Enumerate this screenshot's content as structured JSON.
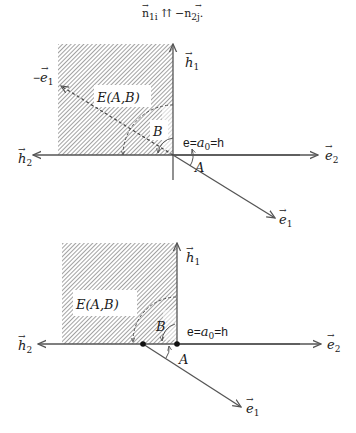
{
  "caption": {
    "n1": "n",
    "n1_sub": "1i",
    "relation": "⇈",
    "minus": "−",
    "n2": "n",
    "n2_sub": "2j",
    "end": "."
  },
  "diagrams": [
    {
      "id": "top",
      "region_label": "E(A,B)",
      "angle_A": "A",
      "angle_B": "B",
      "equation_e": "e=",
      "equation_a": "a",
      "equation_a_sub": "0",
      "equation_h": "=h",
      "axis_h1": "h",
      "axis_h1_sub": "1",
      "axis_h2": "h",
      "axis_h2_sub": "2",
      "axis_e2": "e",
      "axis_e2_sub": "2",
      "axis_e1": "e",
      "axis_e1_sub": "1",
      "axis_neg_e1_minus": "−",
      "axis_neg_e1": "e",
      "axis_neg_e1_sub": "1"
    },
    {
      "id": "bottom",
      "region_label": "E(A,B)",
      "angle_A": "A",
      "angle_B": "B",
      "equation_e": "e=",
      "equation_a": "a",
      "equation_a_sub": "0",
      "equation_h": "=h",
      "axis_h1": "h",
      "axis_h1_sub": "1",
      "axis_h2": "h",
      "axis_h2_sub": "2",
      "axis_e2": "e",
      "axis_e2_sub": "2",
      "axis_e1": "e",
      "axis_e1_sub": "1"
    }
  ],
  "colors": {
    "line": "#555555",
    "hatch": "#8a8a8a",
    "text": "#1a1a1a",
    "background": "#ffffff"
  }
}
